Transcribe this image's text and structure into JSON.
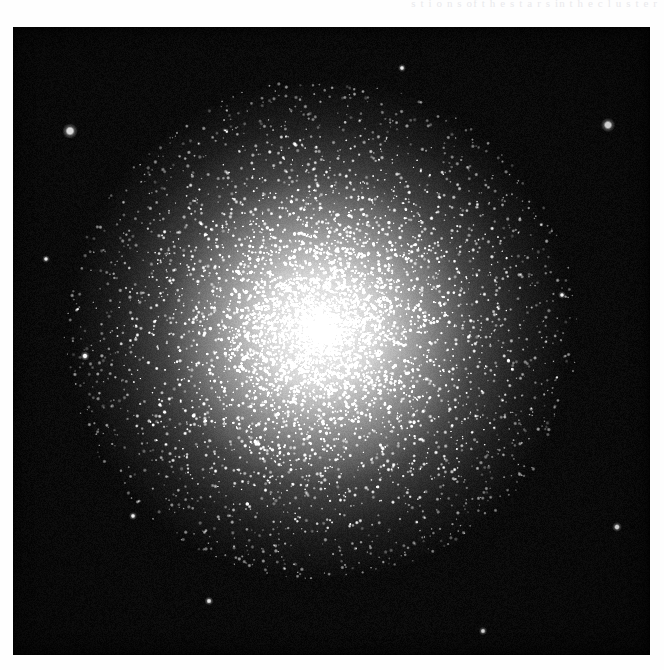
{
  "page": {
    "background_color": "#fefefe",
    "text_remnant": "s t i o n s    of    t h e    s t a r s    in    t h e    c l u s t e r"
  },
  "plate": {
    "label": "globular-cluster-photographic-plate",
    "background_color": "#050505",
    "frame": {
      "x": 13,
      "y": 27,
      "width": 637,
      "height": 628
    },
    "subject": "globular star cluster"
  },
  "chart_data": {
    "type": "scatter",
    "title": "",
    "xlabel": "",
    "ylabel": "",
    "grid": false,
    "legend": null,
    "xlim": [
      0,
      637
    ],
    "ylim": [
      0,
      628
    ],
    "cluster": {
      "center_x": 307,
      "center_y": 303,
      "core_radius": 78,
      "halo_radius": 252,
      "core_peak_brightness": 0.97,
      "resolved_star_count": 7200,
      "field_star_count": 1500,
      "core_glow_stops": [
        {
          "radius_frac": 0.0,
          "alpha": 0.93
        },
        {
          "radius_frac": 0.22,
          "alpha": 0.8
        },
        {
          "radius_frac": 0.42,
          "alpha": 0.5
        },
        {
          "radius_frac": 0.62,
          "alpha": 0.22
        },
        {
          "radius_frac": 0.82,
          "alpha": 0.07
        },
        {
          "radius_frac": 1.0,
          "alpha": 0.0
        }
      ]
    },
    "bright_field_stars": [
      {
        "x": 57,
        "y": 104,
        "radius": 4.6,
        "brightness": 1.0
      },
      {
        "x": 595,
        "y": 98,
        "radius": 4.3,
        "brightness": 1.0
      },
      {
        "x": 72,
        "y": 329,
        "radius": 2.8,
        "brightness": 0.88
      },
      {
        "x": 604,
        "y": 500,
        "radius": 2.9,
        "brightness": 0.9
      },
      {
        "x": 196,
        "y": 574,
        "radius": 2.6,
        "brightness": 0.86
      },
      {
        "x": 470,
        "y": 604,
        "radius": 2.5,
        "brightness": 0.84
      },
      {
        "x": 120,
        "y": 489,
        "radius": 2.4,
        "brightness": 0.82
      },
      {
        "x": 389,
        "y": 41,
        "radius": 2.4,
        "brightness": 0.82
      },
      {
        "x": 549,
        "y": 268,
        "radius": 2.3,
        "brightness": 0.8
      },
      {
        "x": 33,
        "y": 232,
        "radius": 2.3,
        "brightness": 0.8
      }
    ],
    "seed": 20250411
  }
}
